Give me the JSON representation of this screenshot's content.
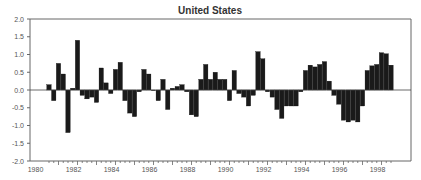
{
  "chart_data": {
    "type": "bar",
    "title": "United States",
    "xlabel": "",
    "ylabel": "",
    "ylim": [
      -2.0,
      2.0
    ],
    "yticks": [
      "2.0",
      "1.5",
      "1.0",
      "0.5",
      "0.0",
      "-0.5",
      "-1.0",
      "-1.5",
      "-2.0"
    ],
    "xtick_labels": [
      "1980",
      "1982",
      "1984",
      "1986",
      "1988",
      "1990",
      "1992",
      "1994",
      "1996",
      "1998"
    ],
    "grid": false,
    "legend": null,
    "frequency": "quarterly",
    "start": "1980Q3",
    "categories": [
      "1980Q3",
      "1980Q4",
      "1981Q1",
      "1981Q2",
      "1981Q3",
      "1981Q4",
      "1982Q1",
      "1982Q2",
      "1982Q3",
      "1982Q4",
      "1983Q1",
      "1983Q2",
      "1983Q3",
      "1983Q4",
      "1984Q1",
      "1984Q2",
      "1984Q3",
      "1984Q4",
      "1985Q1",
      "1985Q2",
      "1985Q3",
      "1985Q4",
      "1986Q1",
      "1986Q2",
      "1986Q3",
      "1986Q4",
      "1987Q1",
      "1987Q2",
      "1987Q3",
      "1987Q4",
      "1988Q1",
      "1988Q2",
      "1988Q3",
      "1988Q4",
      "1989Q1",
      "1989Q2",
      "1989Q3",
      "1989Q4",
      "1990Q1",
      "1990Q2",
      "1990Q3",
      "1990Q4",
      "1991Q1",
      "1991Q2",
      "1991Q3",
      "1991Q4",
      "1992Q1",
      "1992Q2",
      "1992Q3",
      "1992Q4",
      "1993Q1",
      "1993Q2",
      "1993Q3",
      "1993Q4",
      "1994Q1",
      "1994Q2",
      "1994Q3",
      "1994Q4",
      "1995Q1",
      "1995Q2",
      "1995Q3",
      "1995Q4",
      "1996Q1",
      "1996Q2",
      "1996Q3",
      "1996Q4",
      "1997Q1",
      "1997Q2",
      "1997Q3",
      "1997Q4",
      "1998Q1",
      "1998Q2",
      "1998Q3"
    ],
    "values": [
      0.15,
      -0.3,
      0.75,
      0.45,
      -1.2,
      0.05,
      1.4,
      -0.15,
      -0.25,
      -0.2,
      -0.35,
      0.62,
      0.2,
      -0.1,
      0.58,
      0.78,
      -0.3,
      -0.65,
      -0.75,
      -0.05,
      0.58,
      0.45,
      0.0,
      -0.3,
      0.3,
      -0.55,
      0.05,
      0.1,
      0.15,
      -0.05,
      -0.7,
      -0.75,
      0.3,
      0.72,
      0.3,
      0.5,
      0.3,
      0.3,
      -0.3,
      0.55,
      -0.1,
      -0.2,
      -0.45,
      -0.15,
      1.08,
      0.88,
      -0.05,
      -0.2,
      -0.55,
      -0.8,
      -0.45,
      -0.45,
      -0.45,
      -0.05,
      0.55,
      0.7,
      0.65,
      0.72,
      0.8,
      0.25,
      -0.15,
      -0.4,
      -0.85,
      -0.9,
      -0.85,
      -0.9,
      -0.45,
      0.55,
      0.68,
      0.72,
      1.05,
      1.02,
      0.7
    ],
    "colors": {
      "bar": "#1a1a1a",
      "axis": "#666666",
      "zero_line": "#444444",
      "title": "#333333",
      "tick_label": "#555555"
    }
  }
}
